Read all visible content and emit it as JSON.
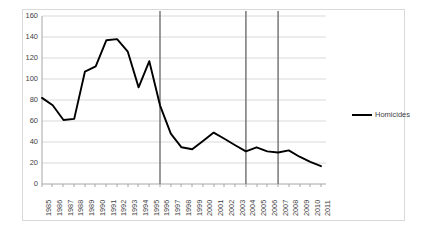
{
  "chart_data": {
    "type": "line",
    "title": "",
    "xlabel": "",
    "ylabel": "",
    "ylim": [
      0,
      160
    ],
    "ytick_step": 20,
    "yticks": [
      "160",
      "140",
      "120",
      "100",
      "80",
      "60",
      "40",
      "20",
      "0"
    ],
    "grid": true,
    "legend_position": "right",
    "categories": [
      "1985",
      "1986",
      "1987",
      "1988",
      "1989",
      "1990",
      "1991",
      "1992",
      "1993",
      "1994",
      "1995",
      "1996",
      "1997",
      "1998",
      "1999",
      "2000",
      "2001",
      "2002",
      "2003",
      "2004",
      "2005",
      "2006",
      "2007",
      "2008",
      "2009",
      "2010",
      "2011"
    ],
    "series": [
      {
        "name": "Homicides",
        "color": "#000000",
        "values": [
          82,
          75,
          61,
          62,
          107,
          112,
          137,
          138,
          126,
          92,
          117,
          75,
          48,
          35,
          33,
          41,
          49,
          43,
          37,
          31,
          35,
          31,
          30,
          32,
          26,
          21,
          17
        ]
      }
    ],
    "reference_lines": [
      {
        "at": "1996",
        "color": "#808080"
      },
      {
        "at": "2004",
        "color": "#808080"
      },
      {
        "at": "2007",
        "color": "#808080"
      }
    ]
  },
  "legend": {
    "entries": [
      {
        "label": "Homicides"
      }
    ]
  }
}
